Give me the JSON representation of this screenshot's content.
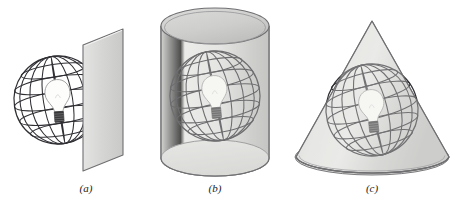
{
  "figure": {
    "background_color": "#ffffff",
    "width": 473,
    "height": 202,
    "line_color": "#2f2f34",
    "surface_edge_color": "#6f6f72",
    "surface_fill_light": "#efefee",
    "surface_fill_mid": "#d9d9d7",
    "surface_fill_dark": "#bdbdbb",
    "bulb_glass_color": "#fdfdfb",
    "bulb_base_color": "#3a3a3c"
  },
  "panels": [
    {
      "id": "panel-a",
      "caption": "(a)",
      "caption_x": 86,
      "caption_y": 192,
      "surface": "plane",
      "surface_name": "planar-projection-surface",
      "globe": {
        "cx": 58,
        "cy": 100,
        "r": 44
      },
      "bulb": {
        "cx": 58,
        "cy": 100
      }
    },
    {
      "id": "panel-b",
      "caption": "(b)",
      "caption_x": 215,
      "caption_y": 192,
      "surface": "cylinder",
      "surface_name": "cylindrical-projection-surface",
      "globe": {
        "cx": 215,
        "cy": 96,
        "r": 45
      },
      "bulb": {
        "cx": 215,
        "cy": 96
      }
    },
    {
      "id": "panel-c",
      "caption": "(c)",
      "caption_x": 372,
      "caption_y": 192,
      "surface": "cone",
      "surface_name": "conic-projection-surface",
      "globe": {
        "cx": 372,
        "cy": 110,
        "r": 46
      },
      "bulb": {
        "cx": 372,
        "cy": 110
      }
    }
  ],
  "chart_data": {
    "type": "diagram",
    "categories": [
      "(a)",
      "(b)",
      "(c)"
    ],
    "series": [
      {
        "name": "surface",
        "values": [
          "plane",
          "cylinder",
          "cone"
        ]
      },
      {
        "name": "projection_family",
        "values": [
          "azimuthal / planar",
          "cylindrical",
          "conic"
        ]
      }
    ],
    "annotations": [
      "Wireframe globe (graticule of meridians and parallels) with a light source inside",
      "Light bulb at globe center casts the graticule onto the developable surface"
    ],
    "legend": "none",
    "grid": false
  }
}
